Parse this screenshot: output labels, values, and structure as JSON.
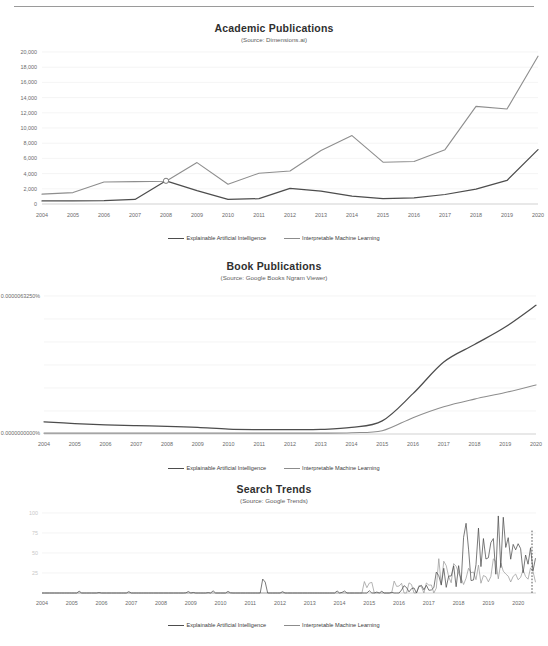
{
  "page": {
    "has_top_rule": true,
    "background": "#ffffff",
    "series_colors": {
      "explainable_artificial_intelligence": "#4d4d4d",
      "interpretable_machine_learning": "#8e8e8e"
    }
  },
  "legend": {
    "items": [
      {
        "label": "Explainable Artificial Intelligence",
        "key": "xai"
      },
      {
        "label": "Interpretable Machine Learning",
        "key": "iml"
      }
    ]
  },
  "charts": [
    {
      "id": "academic-publications",
      "title": "Academic Publications",
      "source": "(Source: Dimensions.ai)"
    },
    {
      "id": "book-publications",
      "title": "Book Publications",
      "source": "(Source: Google Books  Ngram Viewer)"
    },
    {
      "id": "search-trends",
      "title": "Search Trends",
      "source": "(Source: Google Trends)"
    }
  ],
  "chart_data": [
    {
      "type": "line",
      "id": "academic-publications",
      "title": "Academic Publications",
      "subtitle": "(Source: Dimensions.ai)",
      "xlabel": "",
      "ylabel": "",
      "grid": true,
      "legend_position": "bottom",
      "x": [
        2004,
        2005,
        2006,
        2007,
        2008,
        2009,
        2010,
        2011,
        2012,
        2013,
        2014,
        2015,
        2016,
        2017,
        2018,
        2019,
        2020
      ],
      "xtick_labels": [
        "2004",
        "2005",
        "2006",
        "2007",
        "2008",
        "2009",
        "2010",
        "2011",
        "2012",
        "2013",
        "2014",
        "2015",
        "2016",
        "2017",
        "2018",
        "2019",
        "2020"
      ],
      "ylim": [
        0,
        20000
      ],
      "ytick_values": [
        0,
        2000,
        4000,
        6000,
        8000,
        10000,
        12000,
        14000,
        16000,
        18000,
        20000
      ],
      "ytick_labels": [
        "0",
        "2,000",
        "4,000",
        "6,000",
        "8,000",
        "10,000",
        "12,000",
        "14,000",
        "16,000",
        "18,000",
        "20,000"
      ],
      "series": [
        {
          "name": "Explainable Artificial Intelligence",
          "color": "#4d4d4d",
          "values": [
            400,
            420,
            440,
            600,
            3050,
            1750,
            620,
            700,
            2050,
            1700,
            1050,
            720,
            800,
            1250,
            1950,
            3100,
            7150
          ]
        },
        {
          "name": "Interpretable Machine Learning",
          "color": "#8e8e8e",
          "values": [
            1300,
            1500,
            2900,
            2950,
            3000,
            5450,
            2600,
            4050,
            4350,
            7050,
            9000,
            5500,
            5600,
            7150,
            12850,
            12500,
            19450
          ]
        }
      ],
      "annotations": [
        {
          "type": "marker",
          "shape": "open-circle",
          "x": 2008,
          "y": 3050,
          "note": "crossover point where both series intersect"
        }
      ]
    },
    {
      "type": "line",
      "id": "book-publications",
      "title": "Book Publications",
      "subtitle": "(Source: Google Books  Ngram Viewer)",
      "xlabel": "",
      "ylabel": "",
      "grid": true,
      "legend_position": "bottom",
      "x": [
        2004,
        2005,
        2006,
        2007,
        2008,
        2009,
        2010,
        2011,
        2012,
        2013,
        2014,
        2015,
        2016,
        2017,
        2018,
        2019,
        2020
      ],
      "xtick_labels": [
        "2004",
        "2005",
        "2006",
        "2007",
        "2008",
        "2009",
        "2010",
        "2011",
        "2012",
        "2013",
        "2014",
        "2015",
        "2016",
        "2017",
        "2018",
        "2019",
        "2020"
      ],
      "ylim": [
        0,
        6.325e-06
      ],
      "ytick_values": [
        0,
        6.325e-06
      ],
      "ytick_labels": [
        "0.0000000000%",
        "0.0000063250%"
      ],
      "yunit": "percent",
      "series": [
        {
          "name": "Explainable Artificial Intelligence",
          "color": "#4d4d4d",
          "values_percent": [
            5.6e-07,
            4.8e-07,
            4.2e-07,
            3.8e-07,
            3.5e-07,
            3e-07,
            2.2e-07,
            2e-07,
            2e-07,
            2.1e-07,
            3e-07,
            6e-07,
            1.85e-06,
            3.3e-06,
            4.1e-06,
            4.9e-06,
            5.9e-06
          ]
        },
        {
          "name": "Interpretable Machine Learning",
          "color": "#8e8e8e",
          "values_percent": [
            4e-08,
            4e-08,
            4e-08,
            4e-08,
            4e-08,
            4e-08,
            4e-08,
            4e-08,
            4e-08,
            4e-08,
            6e-08,
            1.5e-07,
            7.5e-07,
            1.25e-06,
            1.6e-06,
            1.9e-06,
            2.25e-06
          ]
        }
      ]
    },
    {
      "type": "line",
      "id": "search-trends",
      "title": "Search Trends",
      "subtitle": "(Source: Google Trends)",
      "xlabel": "",
      "ylabel": "",
      "grid": true,
      "legend_position": "bottom",
      "x_range": [
        2004,
        2020.6
      ],
      "xtick_labels": [
        "2004",
        "2005",
        "2006",
        "2007",
        "2008",
        "2009",
        "2010",
        "2011",
        "2012",
        "2013",
        "2014",
        "2015",
        "2016",
        "2017",
        "2018",
        "2019",
        "2020"
      ],
      "ylim": [
        0,
        100
      ],
      "ytick_values": [
        25,
        50,
        75,
        100
      ],
      "ytick_labels": [
        "25",
        "50",
        "75",
        "100"
      ],
      "note": "monthly data, noisy; near-zero until ~2014 apart from one 2011 spike to ~25",
      "series": [
        {
          "name": "Explainable Artificial Intelligence",
          "color": "#4d4d4d",
          "description": "flat near 0 until 2017, then rising noisy spikes peaking near 100 in 2019"
        },
        {
          "name": "Interpretable Machine Learning",
          "color": "#9b9b9b",
          "description": "flat near 0 until 2014, small spikes 2014-2017, moderate noise 15-45 through 2020"
        }
      ],
      "events": [
        {
          "x": 2011.45,
          "y": 25,
          "label": "isolated spike"
        },
        {
          "x": 2018.3,
          "y": 88,
          "label": "peak"
        },
        {
          "x": 2019.45,
          "y": 100,
          "label": "maximum"
        }
      ]
    }
  ]
}
